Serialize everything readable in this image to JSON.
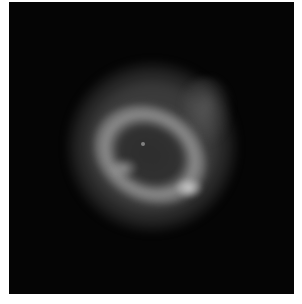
{
  "image": {
    "description": "Grayscale astronomical image of a ring-shaped planetary nebula on a black background",
    "colors": {
      "background": "#050505",
      "border": "#ffffff",
      "nebula_glow": "#787878",
      "ring_bright": "#e1e1e1"
    }
  }
}
